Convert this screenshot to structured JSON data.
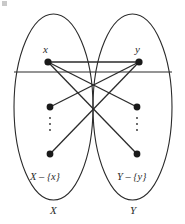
{
  "figure": {
    "background_color": "#ffffff",
    "stroke_color": "#2b2b2b",
    "node_fill": "#1a1a1a"
  },
  "labels": {
    "node_x": "x",
    "node_y": "y",
    "set_x_minus": "X – {x}",
    "set_y_minus": "Y – {y}",
    "set_x": "X",
    "set_y": "Y"
  },
  "geometry": {
    "ellipses": [
      {
        "name": "ellipse-x",
        "cx": 53.5,
        "cy": 107,
        "rx": 39.5,
        "ry": 93
      },
      {
        "name": "ellipse-y",
        "cx": 132.5,
        "cy": 107,
        "rx": 39.5,
        "ry": 93
      }
    ],
    "nodes": [
      {
        "name": "node-x",
        "cx": 48,
        "cy": 62,
        "r": 3.6
      },
      {
        "name": "node-x2",
        "cx": 50,
        "cy": 107,
        "r": 3.4
      },
      {
        "name": "node-x3",
        "cx": 50,
        "cy": 154,
        "r": 3.4
      },
      {
        "name": "node-y",
        "cx": 139,
        "cy": 62,
        "r": 3.6
      },
      {
        "name": "node-y2",
        "cx": 137,
        "cy": 107,
        "r": 3.4
      },
      {
        "name": "node-y3",
        "cx": 137,
        "cy": 154,
        "r": 3.4
      }
    ],
    "edges": [
      {
        "name": "edge-x-y",
        "x1": 48,
        "y1": 62,
        "x2": 139,
        "y2": 62
      },
      {
        "name": "edge-x-y2",
        "x1": 48,
        "y1": 62,
        "x2": 137,
        "y2": 107
      },
      {
        "name": "edge-x-y3",
        "x1": 48,
        "y1": 62,
        "x2": 137,
        "y2": 154
      },
      {
        "name": "edge-y-x2",
        "x1": 139,
        "y1": 62,
        "x2": 50,
        "y2": 107
      },
      {
        "name": "edge-y-x3",
        "x1": 139,
        "y1": 62,
        "x2": 50,
        "y2": 154
      }
    ],
    "horizontal_line": {
      "name": "horizontal-line",
      "x1": 14,
      "y1": 72,
      "x2": 172,
      "y2": 72
    },
    "ellipsis_dots": [
      {
        "name": "ellipsis-left",
        "cx": 50,
        "cy": 124,
        "count": 3
      },
      {
        "name": "ellipsis-right",
        "cx": 137,
        "cy": 124,
        "count": 3
      }
    ]
  }
}
